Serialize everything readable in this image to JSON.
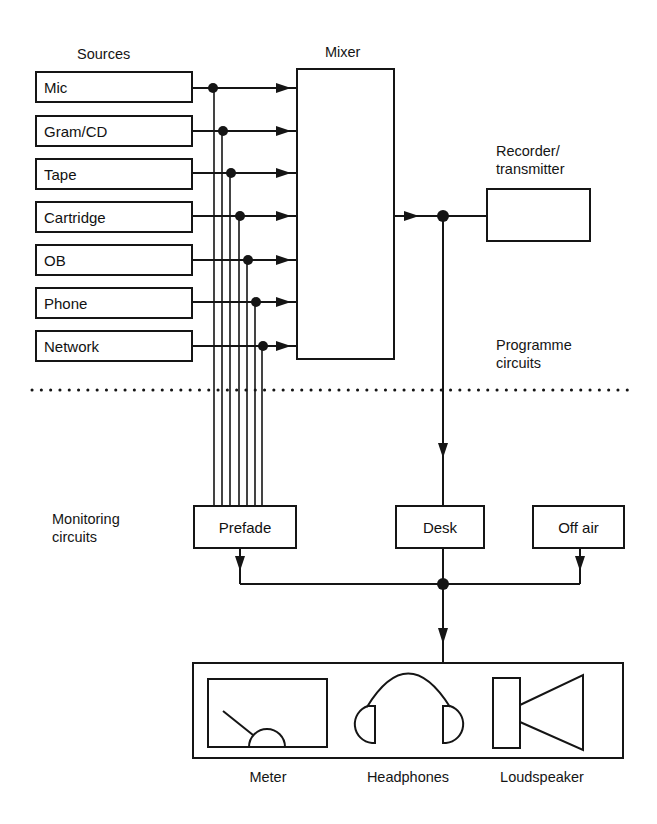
{
  "diagram": {
    "sections": {
      "sources_heading": "Sources",
      "mixer_heading": "Mixer",
      "recorder_heading_line1": "Recorder/",
      "recorder_heading_line2": "transmitter",
      "programme_line1": "Programme",
      "programme_line2": "circuits",
      "monitoring_line1": "Monitoring",
      "monitoring_line2": "circuits"
    },
    "sources": [
      {
        "label": "Mic"
      },
      {
        "label": "Gram/CD"
      },
      {
        "label": "Tape"
      },
      {
        "label": "Cartridge"
      },
      {
        "label": "OB"
      },
      {
        "label": "Phone"
      },
      {
        "label": "Network"
      }
    ],
    "monitoring": {
      "prefade": "Prefade",
      "desk": "Desk",
      "off_air": "Off air"
    },
    "outputs": {
      "meter": "Meter",
      "headphones": "Headphones",
      "loudspeaker": "Loudspeaker"
    },
    "colors": {
      "ink": "#151515",
      "background": "#ffffff"
    }
  }
}
